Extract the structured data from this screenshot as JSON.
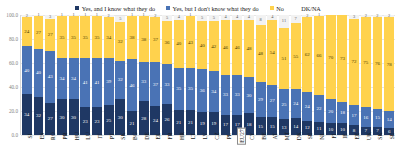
{
  "legend": {
    "items": [
      {
        "label": "Yes, and I know what they do",
        "color": "#1f3864",
        "marker": true
      },
      {
        "label": "Yes, but I don't know what they do",
        "color": "#4a73b5",
        "marker": true
      },
      {
        "label": "No",
        "color": "#ffd24d",
        "marker": true
      },
      {
        "label": "DK/NA",
        "color": "#f2f2f2",
        "marker": false
      }
    ]
  },
  "chart_data": {
    "type": "bar",
    "subtype": "stacked-100-percent",
    "title": "",
    "xlabel": "",
    "ylabel": "",
    "ylim": [
      0,
      100
    ],
    "yticks": [
      "0.0",
      "20.0",
      "40.0",
      "60.0",
      "80.0",
      "100.0"
    ],
    "ytick_values": [
      0,
      20,
      40,
      60,
      80,
      100
    ],
    "grid": true,
    "legend_position": "top",
    "highlight_category": "EU27",
    "categories": [
      "SI",
      "ES",
      "RO",
      "PR",
      "HU",
      "LU",
      "IT",
      "PT",
      "SK",
      "BG",
      "DE",
      "EL",
      "FR",
      "HR",
      "LT",
      "LV",
      "CZ",
      "PL",
      "EU27",
      "CY",
      "BE",
      "AT",
      "MT",
      "DK",
      "SE",
      "NL",
      "FI",
      "IE",
      "EE",
      "UK",
      "SK",
      "SE"
    ],
    "series": [
      {
        "name": "Yes, and I know what they do",
        "color": "#1f3864",
        "values": [
          34,
          32,
          27,
          30,
          30,
          23,
          23,
          25,
          30,
          21,
          28,
          24,
          26,
          21,
          21,
          19,
          19,
          17,
          17,
          18,
          15,
          15,
          13,
          14,
          12,
          11,
          10,
          10,
          8,
          7,
          7,
          6
        ]
      },
      {
        "name": "Yes, but I don't know what they do",
        "color": "#4a73b5",
        "values": [
          40,
          40,
          43,
          34,
          34,
          41,
          41,
          39,
          32,
          46,
          33,
          37,
          33,
          35,
          35,
          36,
          34,
          33,
          33,
          30,
          29,
          27,
          25,
          24,
          24,
          22,
          20,
          18,
          17,
          16,
          15,
          14
        ]
      },
      {
        "name": "No",
        "color": "#ffd24d",
        "values": [
          24,
          27,
          27,
          35,
          35,
          35,
          35,
          34,
          32,
          38,
          38,
          37,
          36,
          40,
          43,
          40,
          42,
          46,
          46,
          48,
          48,
          54,
          51,
          55,
          62,
          66,
          70,
          73,
          72,
          75,
          76,
          78
        ]
      },
      {
        "name": "DK/NA",
        "color": "#f2f2f2",
        "values": [
          2,
          1,
          3,
          1,
          1,
          1,
          1,
          2,
          5,
          1,
          1,
          2,
          5,
          4,
          1,
          5,
          5,
          4,
          4,
          4,
          8,
          4,
          11,
          7,
          2,
          1,
          0,
          0,
          3,
          2,
          2,
          2
        ]
      }
    ]
  }
}
